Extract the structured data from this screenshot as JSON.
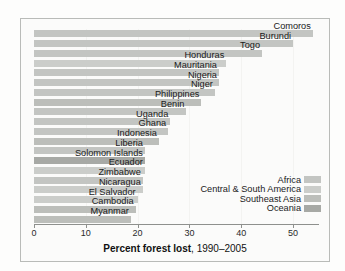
{
  "chart_data": {
    "type": "bar",
    "orientation": "horizontal",
    "title": "Percent forest lost, 1990–2005",
    "title_bold_part": "Percent forest lost",
    "title_plain_part": ", 1990–2005",
    "xlabel": "Percent forest lost, 1990–2005",
    "ylabel": "",
    "xlim": [
      0,
      55
    ],
    "xticks": [
      0,
      10,
      20,
      30,
      40,
      50
    ],
    "xticklabels": [
      "0",
      "10",
      "20",
      "30",
      "40",
      "50"
    ],
    "grid": true,
    "grid_axis": "x",
    "legend_position": "lower right",
    "categories": [
      "Comoros",
      "Burundi",
      "Togo",
      "Honduras",
      "Mauritania",
      "Nigeria",
      "Niger",
      "Philippines",
      "Benin",
      "Uganda",
      "Ghana",
      "Indonesia",
      "Liberia",
      "Solomon Islands",
      "Ecuador",
      "Zimbabwe",
      "Nicaragua",
      "El Salvador",
      "Cambodia",
      "Myanmar"
    ],
    "values": [
      53.8,
      50.0,
      44.0,
      37.1,
      35.7,
      35.7,
      34.9,
      32.3,
      29.4,
      26.3,
      25.9,
      24.1,
      21.4,
      21.4,
      21.4,
      21.0,
      21.0,
      20.0,
      19.6,
      18.7
    ],
    "region_of_bar": [
      "africa",
      "africa",
      "africa",
      "central-south-america",
      "africa",
      "africa",
      "africa",
      "southeast-asia",
      "africa",
      "africa",
      "africa",
      "southeast-asia",
      "africa",
      "oceania",
      "central-south-america",
      "africa",
      "central-south-america",
      "central-south-america",
      "southeast-asia",
      "southeast-asia"
    ],
    "series": [
      {
        "name": "Africa",
        "key": "africa",
        "color": "#c3c5c2"
      },
      {
        "name": "Central & South America",
        "key": "central-south-america",
        "color": "#cbcdca"
      },
      {
        "name": "Southeast Asia",
        "key": "southeast-asia",
        "color": "#bcbeba"
      },
      {
        "name": "Oceania",
        "key": "oceania",
        "color": "#a7a9a5"
      }
    ]
  },
  "legend": {
    "items": [
      {
        "label": "Africa",
        "color": "#c3c5c2"
      },
      {
        "label": "Central & South America",
        "color": "#cbcdca"
      },
      {
        "label": "Southeast Asia",
        "color": "#bcbeba"
      },
      {
        "label": "Oceania",
        "color": "#a7a9a5"
      }
    ]
  }
}
